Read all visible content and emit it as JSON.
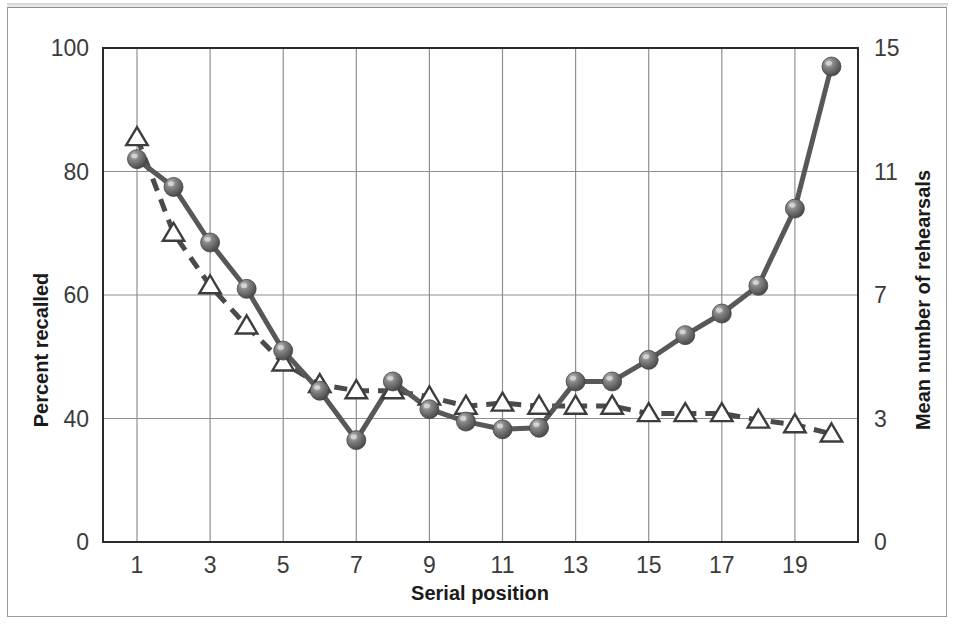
{
  "chart_data": {
    "type": "line",
    "title": "",
    "xlabel": "Serial position",
    "ylabel": "Percent recalled",
    "y2label": "Mean number of rehearsals",
    "x": [
      1,
      2,
      3,
      4,
      5,
      6,
      7,
      8,
      9,
      10,
      11,
      12,
      13,
      14,
      15,
      16,
      17,
      18,
      19,
      20
    ],
    "xtick_labels": [
      "1",
      "3",
      "5",
      "7",
      "9",
      "11",
      "13",
      "15",
      "17",
      "19"
    ],
    "xtick_values": [
      1,
      3,
      5,
      7,
      9,
      11,
      13,
      15,
      17,
      19
    ],
    "xlim": [
      0.5,
      20.5
    ],
    "ytick_labels": [
      "0",
      "40",
      "60",
      "80",
      "100"
    ],
    "ytick_values": [
      0,
      40,
      60,
      80,
      100
    ],
    "ylim": [
      0,
      100
    ],
    "y2tick_labels": [
      "0",
      "3",
      "7",
      "11",
      "15"
    ],
    "y2tick_values": [
      0,
      3,
      7,
      11,
      15
    ],
    "y2lim": [
      0,
      15
    ],
    "grid": true,
    "legend_position": "none",
    "series": [
      {
        "name": "Percent recalled",
        "axis": "left",
        "marker": "circle-sphere",
        "linestyle": "solid",
        "color": "#6b6b6b",
        "values": [
          82,
          77.5,
          68.5,
          61,
          51,
          44.5,
          33,
          46,
          41.5,
          39,
          36.5,
          37,
          46,
          46,
          49.5,
          53.5,
          57,
          61.5,
          74,
          97
        ]
      },
      {
        "name": "Mean number of rehearsals",
        "axis": "right",
        "marker": "triangle-open",
        "linestyle": "dashed",
        "color": "#4a4a4a",
        "values": [
          11.4,
          8.9,
          7.4,
          6.2,
          5.1,
          4.0,
          3.8,
          3.8,
          3.6,
          3.4,
          3.5,
          3.4,
          3.3,
          3.3,
          3.1,
          3.1,
          3.1,
          2.9,
          2.7,
          2.3
        ],
        "values_on_left_scale": [
          85.5,
          70,
          61.5,
          55,
          49,
          45.5,
          44.5,
          44.5,
          43.5,
          42,
          42.5,
          42,
          42,
          42,
          40.8,
          40.8,
          40.8,
          39.5,
          38,
          35
        ]
      }
    ]
  },
  "colors": {
    "plot_border": "#2b2b2b",
    "gridline": "#8f8f8f",
    "circle_marker": "#6b6b6b",
    "triangle_stroke": "#3d3d3d",
    "solid_line": "#585858",
    "dashed_line": "#4a4a4a",
    "tick_text": "#3b3b3b",
    "axis_title_text": "#1a1a1a",
    "figure_frame": "#9a9a9a"
  }
}
